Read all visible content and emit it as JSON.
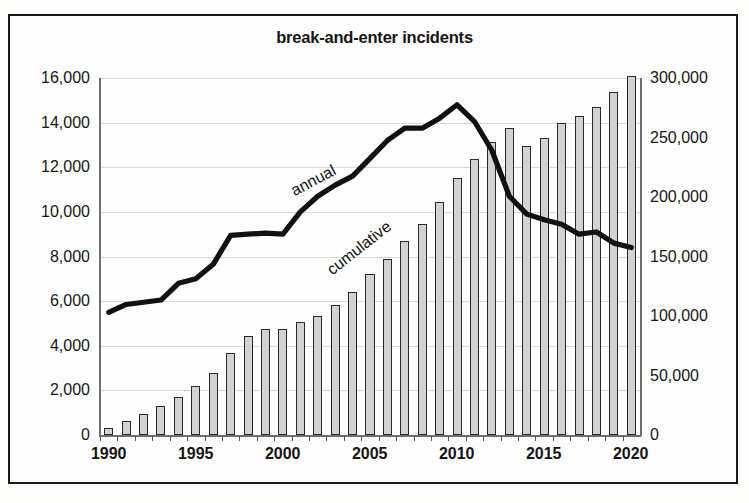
{
  "chart_data": {
    "type": "bar",
    "title": "break-and-enter incidents",
    "xlabel": "",
    "ylabel": "",
    "grid": true,
    "legend_position": "inline-labels",
    "x": [
      1990,
      1991,
      1992,
      1993,
      1994,
      1995,
      1996,
      1997,
      1998,
      1999,
      2000,
      2001,
      2002,
      2003,
      2004,
      2005,
      2006,
      2007,
      2008,
      2009,
      2010,
      2011,
      2012,
      2013,
      2014,
      2015,
      2016,
      2017,
      2018,
      2019,
      2020
    ],
    "xtick_labels": [
      "1990",
      "1995",
      "2000",
      "2005",
      "2010",
      "2015",
      "2020"
    ],
    "xticks": [
      1990,
      1995,
      2000,
      2005,
      2010,
      2015,
      2020
    ],
    "axes": [
      {
        "id": "left",
        "name": "annual",
        "ylim": [
          0,
          16000
        ],
        "ytick_labels": [
          "0",
          "2,000",
          "4,000",
          "6,000",
          "8,000",
          "10,000",
          "12,000",
          "14,000",
          "16,000"
        ],
        "yticks": [
          0,
          2000,
          4000,
          6000,
          8000,
          10000,
          12000,
          14000,
          16000
        ]
      },
      {
        "id": "right",
        "name": "cumulative",
        "ylim": [
          0,
          300000
        ],
        "ytick_labels": [
          "0",
          "50,000",
          "100,000",
          "150,000",
          "200,000",
          "250,000",
          "300,000"
        ],
        "yticks": [
          0,
          50000,
          100000,
          150000,
          200000,
          250000,
          300000
        ]
      }
    ],
    "series": [
      {
        "name": "cumulative",
        "type": "bar",
        "axis": "right",
        "color": "#d2d2d0",
        "edge_color": "#2a2a2a",
        "annotation": "cumulative",
        "values": [
          5500,
          11500,
          17500,
          24000,
          32000,
          41000,
          52000,
          69000,
          83000,
          89000,
          89000,
          95000,
          100000,
          109000,
          120000,
          135000,
          148000,
          163000,
          177000,
          196000,
          216000,
          232000,
          246000,
          258000,
          243000,
          250000,
          262000,
          268000,
          276000,
          288000,
          302000
        ]
      },
      {
        "name": "annual",
        "type": "line",
        "axis": "left",
        "color": "#111111",
        "annotation": "annual",
        "values": [
          5500,
          5850,
          5950,
          6050,
          6800,
          7000,
          7650,
          8950,
          9000,
          9050,
          9000,
          10000,
          10700,
          11200,
          11600,
          12400,
          13200,
          13750,
          13750,
          14200,
          14800,
          14050,
          12750,
          10700,
          9900,
          9650,
          9450,
          9000,
          9100,
          8600,
          8400
        ]
      }
    ]
  }
}
